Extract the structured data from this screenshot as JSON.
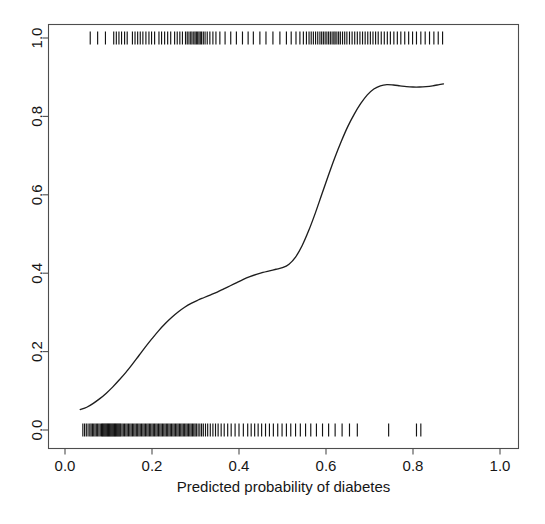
{
  "figure": {
    "width": 545,
    "height": 524,
    "background": "#ffffff",
    "foreground": "#161616"
  },
  "chart_data": {
    "type": "line",
    "title": "",
    "subtitle": "",
    "xlabel": "Predicted probability of diabetes",
    "ylabel": "",
    "xlim": [
      0.0,
      1.0
    ],
    "ylim": [
      0.0,
      1.0
    ],
    "grid": false,
    "legend": "none",
    "xticks": [
      0.0,
      0.2,
      0.4,
      0.6,
      0.8,
      1.0
    ],
    "xtick_labels": [
      "0.0",
      "0.2",
      "0.4",
      "0.6",
      "0.8",
      "1.0"
    ],
    "yticks": [
      0.0,
      0.2,
      0.4,
      0.6,
      0.8,
      1.0
    ],
    "ytick_labels": [
      "0.0",
      "0.2",
      "0.4",
      "0.6",
      "0.8",
      "1.0"
    ],
    "ytick_rotation": 90,
    "series": [
      {
        "name": "lowess smooth of observed outcome vs predicted probability",
        "kind": "line",
        "color": "#1e1e1e",
        "x": [
          0.035,
          0.05,
          0.065,
          0.08,
          0.095,
          0.11,
          0.125,
          0.14,
          0.155,
          0.17,
          0.185,
          0.2,
          0.215,
          0.23,
          0.245,
          0.26,
          0.275,
          0.29,
          0.305,
          0.32,
          0.335,
          0.35,
          0.365,
          0.38,
          0.395,
          0.41,
          0.425,
          0.44,
          0.455,
          0.47,
          0.485,
          0.5,
          0.515,
          0.53,
          0.545,
          0.56,
          0.575,
          0.59,
          0.605,
          0.62,
          0.635,
          0.65,
          0.665,
          0.68,
          0.695,
          0.71,
          0.725,
          0.74,
          0.755,
          0.77,
          0.785,
          0.8,
          0.815,
          0.83,
          0.845,
          0.86,
          0.87
        ],
        "y": [
          0.052,
          0.058,
          0.068,
          0.08,
          0.094,
          0.11,
          0.128,
          0.147,
          0.168,
          0.19,
          0.212,
          0.233,
          0.253,
          0.271,
          0.287,
          0.301,
          0.313,
          0.323,
          0.331,
          0.338,
          0.345,
          0.352,
          0.36,
          0.368,
          0.376,
          0.384,
          0.391,
          0.397,
          0.402,
          0.406,
          0.41,
          0.414,
          0.423,
          0.441,
          0.47,
          0.508,
          0.552,
          0.6,
          0.648,
          0.694,
          0.736,
          0.774,
          0.806,
          0.833,
          0.855,
          0.87,
          0.878,
          0.881,
          0.88,
          0.878,
          0.876,
          0.875,
          0.875,
          0.876,
          0.878,
          0.881,
          0.883
        ]
      },
      {
        "name": "rug: observations with outcome = 1 (diabetes)",
        "kind": "rug",
        "y_level": 1.0,
        "color": "#141414",
        "x": [
          0.058,
          0.075,
          0.093,
          0.112,
          0.118,
          0.124,
          0.13,
          0.137,
          0.143,
          0.155,
          0.161,
          0.167,
          0.173,
          0.179,
          0.186,
          0.193,
          0.199,
          0.206,
          0.216,
          0.222,
          0.229,
          0.236,
          0.243,
          0.252,
          0.258,
          0.264,
          0.27,
          0.277,
          0.281,
          0.285,
          0.289,
          0.292,
          0.296,
          0.299,
          0.302,
          0.305,
          0.308,
          0.311,
          0.314,
          0.318,
          0.322,
          0.327,
          0.333,
          0.34,
          0.347,
          0.356,
          0.368,
          0.381,
          0.394,
          0.408,
          0.421,
          0.433,
          0.448,
          0.462,
          0.478,
          0.494,
          0.509,
          0.52,
          0.531,
          0.54,
          0.548,
          0.555,
          0.561,
          0.566,
          0.571,
          0.576,
          0.581,
          0.586,
          0.59,
          0.594,
          0.598,
          0.602,
          0.606,
          0.61,
          0.614,
          0.618,
          0.621,
          0.625,
          0.629,
          0.633,
          0.638,
          0.643,
          0.648,
          0.654,
          0.66,
          0.666,
          0.672,
          0.678,
          0.684,
          0.69,
          0.696,
          0.702,
          0.708,
          0.714,
          0.72,
          0.727,
          0.734,
          0.741,
          0.748,
          0.756,
          0.764,
          0.772,
          0.781,
          0.79,
          0.799,
          0.808,
          0.818,
          0.828,
          0.838,
          0.848,
          0.858,
          0.868
        ]
      },
      {
        "name": "rug: observations with outcome = 0 (no diabetes)",
        "kind": "rug",
        "y_level": 0.0,
        "color": "#141414",
        "x": [
          0.041,
          0.045,
          0.049,
          0.053,
          0.057,
          0.06,
          0.063,
          0.066,
          0.069,
          0.072,
          0.075,
          0.078,
          0.081,
          0.084,
          0.086,
          0.088,
          0.09,
          0.092,
          0.094,
          0.096,
          0.098,
          0.1,
          0.102,
          0.104,
          0.106,
          0.108,
          0.11,
          0.112,
          0.114,
          0.116,
          0.118,
          0.12,
          0.122,
          0.124,
          0.126,
          0.128,
          0.131,
          0.134,
          0.137,
          0.14,
          0.143,
          0.146,
          0.149,
          0.152,
          0.155,
          0.158,
          0.161,
          0.164,
          0.167,
          0.17,
          0.173,
          0.176,
          0.179,
          0.182,
          0.185,
          0.188,
          0.191,
          0.194,
          0.197,
          0.2,
          0.203,
          0.206,
          0.209,
          0.212,
          0.215,
          0.218,
          0.221,
          0.224,
          0.227,
          0.23,
          0.233,
          0.236,
          0.239,
          0.242,
          0.245,
          0.248,
          0.251,
          0.254,
          0.257,
          0.26,
          0.263,
          0.266,
          0.269,
          0.272,
          0.275,
          0.278,
          0.281,
          0.284,
          0.287,
          0.29,
          0.293,
          0.296,
          0.299,
          0.302,
          0.306,
          0.31,
          0.314,
          0.318,
          0.323,
          0.328,
          0.334,
          0.34,
          0.346,
          0.352,
          0.359,
          0.366,
          0.374,
          0.382,
          0.391,
          0.4,
          0.41,
          0.42,
          0.428,
          0.436,
          0.444,
          0.452,
          0.461,
          0.47,
          0.479,
          0.489,
          0.499,
          0.509,
          0.519,
          0.53,
          0.541,
          0.553,
          0.565,
          0.578,
          0.592,
          0.606,
          0.621,
          0.637,
          0.654,
          0.672,
          0.744,
          0.808,
          0.818
        ]
      }
    ],
    "annotations": []
  }
}
